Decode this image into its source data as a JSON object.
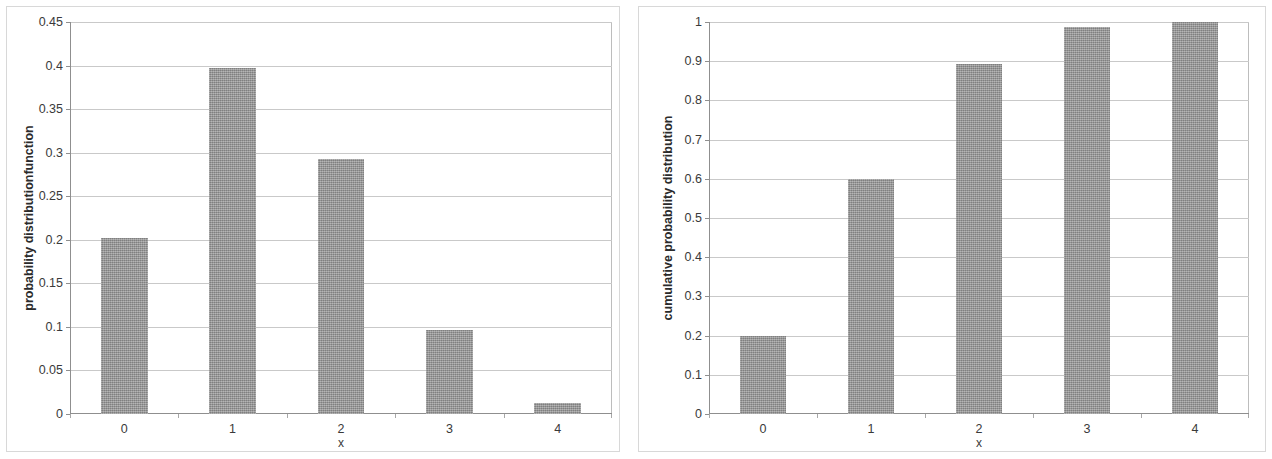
{
  "chart_data": [
    {
      "id": "pdf",
      "type": "bar",
      "title": "",
      "xlabel": "x",
      "ylabel": "probability distributionfunction",
      "categories": [
        "0",
        "1",
        "2",
        "3",
        "4"
      ],
      "values": [
        0.202,
        0.397,
        0.293,
        0.097,
        0.013
      ],
      "ylim": [
        0,
        0.45
      ],
      "yticks": [
        "0",
        "0.05",
        "0.1",
        "0.15",
        "0.2",
        "0.25",
        "0.3",
        "0.35",
        "0.4",
        "0.45"
      ],
      "ytick_values": [
        0,
        0.05,
        0.1,
        0.15,
        0.2,
        0.25,
        0.3,
        0.35,
        0.4,
        0.45
      ],
      "grid": true,
      "legend": "none",
      "bar_color": "#9a9a9a",
      "gridline_color": "#c9c9c9",
      "axis_color": "#8f8f8f"
    },
    {
      "id": "cdf",
      "type": "bar",
      "title": "",
      "xlabel": "x",
      "ylabel": "cumulative probability distribution",
      "categories": [
        "0",
        "1",
        "2",
        "3",
        "4"
      ],
      "values": [
        0.2,
        0.6,
        0.893,
        0.987,
        1.0
      ],
      "ylim": [
        0,
        1
      ],
      "yticks": [
        "0",
        "0.1",
        "0.2",
        "0.3",
        "0.4",
        "0.5",
        "0.6",
        "0.7",
        "0.8",
        "0.9",
        "1"
      ],
      "ytick_values": [
        0,
        0.1,
        0.2,
        0.3,
        0.4,
        0.5,
        0.6,
        0.7,
        0.8,
        0.9,
        1
      ],
      "grid": true,
      "legend": "none",
      "bar_color": "#9a9a9a",
      "gridline_color": "#c9c9c9",
      "axis_color": "#8f8f8f"
    }
  ]
}
